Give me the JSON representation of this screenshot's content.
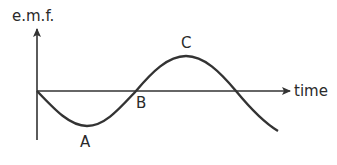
{
  "diagram": {
    "y_axis_label": "e.m.f.",
    "x_axis_label": "time",
    "points": [
      {
        "label": "A",
        "description": "minimum (negative peak)"
      },
      {
        "label": "B",
        "description": "zero crossing"
      },
      {
        "label": "C",
        "description": "maximum (positive peak)"
      }
    ],
    "curve": "inverted sine wave starting at origin",
    "colors": {
      "stroke": "#333333",
      "text": "#2a2a2a"
    }
  }
}
